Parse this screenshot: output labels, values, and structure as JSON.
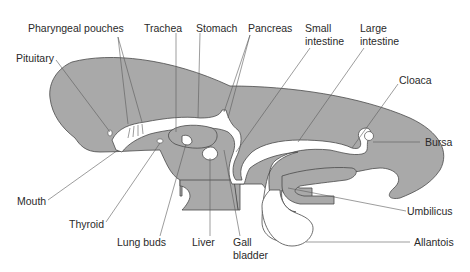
{
  "diagram": {
    "colors": {
      "tissue": "#a9a9a9",
      "outline": "#4a4a4a",
      "lumen": "#ffffff",
      "label_text": "#2a2a2a"
    },
    "labels": {
      "pharyngeal_pouches": "Pharyngeal pouches",
      "trachea": "Trachea",
      "stomach": "Stomach",
      "pancreas": "Pancreas",
      "small_intestine_1": "Small",
      "small_intestine_2": "intestine",
      "large_intestine_1": "Large",
      "large_intestine_2": "intestine",
      "pituitary": "Pituitary",
      "cloaca": "Cloaca",
      "bursa": "Bursa",
      "mouth": "Mouth",
      "thyroid": "Thyroid",
      "lung_buds": "Lung buds",
      "liver": "Liver",
      "gall_bladder_1": "Gall",
      "gall_bladder_2": "bladder",
      "umbilicus": "Umbilicus",
      "allantois": "Allantois"
    }
  }
}
